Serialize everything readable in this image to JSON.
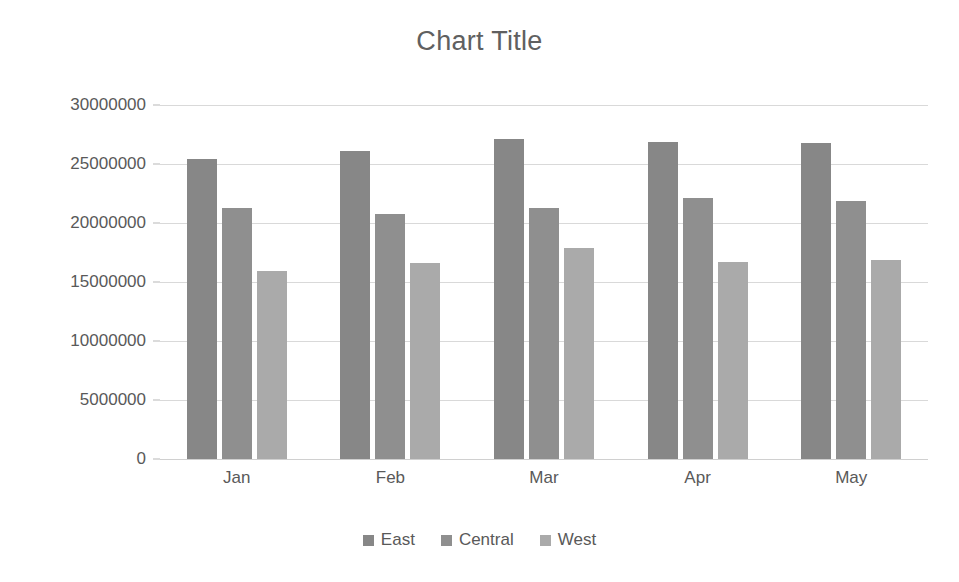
{
  "chart_data": {
    "type": "bar",
    "title": "Chart Title",
    "xlabel": "",
    "ylabel": "",
    "categories": [
      "Jan",
      "Feb",
      "Mar",
      "Apr",
      "May"
    ],
    "series": [
      {
        "name": "East",
        "color": "#878787",
        "values": [
          25400000,
          26100000,
          27100000,
          26900000,
          26800000
        ]
      },
      {
        "name": "Central",
        "color": "#8f8f8f",
        "values": [
          21300000,
          20800000,
          21300000,
          22100000,
          21900000
        ]
      },
      {
        "name": "West",
        "color": "#aaaaaa",
        "values": [
          15900000,
          16600000,
          17900000,
          16700000,
          16900000
        ]
      }
    ],
    "ylim": [
      0,
      30000000
    ],
    "ytick_step": 5000000,
    "ytick_labels": [
      "30000000",
      "25000000",
      "20000000",
      "15000000",
      "10000000",
      "5000000",
      "0"
    ],
    "ytick_values": [
      30000000,
      25000000,
      20000000,
      15000000,
      10000000,
      5000000,
      0
    ],
    "grid": true,
    "legend_position": "bottom",
    "background_color": "#ffffff",
    "gridline_color": "#d9d9d9",
    "text_color": "#595959"
  }
}
